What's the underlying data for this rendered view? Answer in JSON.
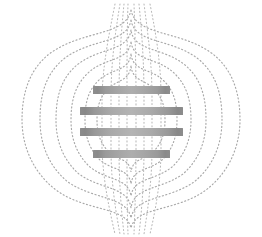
{
  "figure": {
    "background_color": "#ffffff",
    "width": 262,
    "height": 237
  },
  "chart_data": {
    "type": "diagram",
    "xlabel": "",
    "ylabel": "",
    "grid": false,
    "legend": null,
    "axis_ranges": {
      "x": [
        0,
        262
      ],
      "y": [
        0,
        237
      ]
    },
    "elements": {
      "coil_bars": [
        {
          "name": "coil-bar-1",
          "kind": "short",
          "x": 93,
          "y": 86,
          "width": 77,
          "height": 8,
          "fill_edge_color": "#8e8e8e",
          "fill_center_color": "#aeaeae"
        },
        {
          "name": "coil-bar-2",
          "kind": "long",
          "x": 80,
          "y": 107,
          "width": 103,
          "height": 8,
          "fill_edge_color": "#8c8c8c",
          "fill_center_color": "#b4b4b4"
        },
        {
          "name": "coil-bar-3",
          "kind": "long",
          "x": 80,
          "y": 128,
          "width": 103,
          "height": 8,
          "fill_edge_color": "#8c8c8c",
          "fill_center_color": "#b4b4b4"
        },
        {
          "name": "coil-bar-4",
          "kind": "short",
          "x": 93,
          "y": 150,
          "width": 77,
          "height": 8,
          "fill_edge_color": "#8e8e8e",
          "fill_center_color": "#aeaeae"
        }
      ],
      "field_lines": {
        "style": "dotted",
        "stroke_color": "#a8a8a8",
        "stroke_width": 1.15,
        "dash_pattern": "1.1 2.5",
        "loop_count": 6,
        "axis_line_count": 8,
        "loops": [
          {
            "name": "field-loop-outer-1",
            "half_width": 108,
            "top_y": 10,
            "bottom_y": 228
          },
          {
            "name": "field-loop-outer-2",
            "half_width": 88,
            "top_y": 20,
            "bottom_y": 218
          },
          {
            "name": "field-loop-mid-1",
            "half_width": 70,
            "top_y": 30,
            "bottom_y": 208
          },
          {
            "name": "field-loop-mid-2",
            "half_width": 54,
            "top_y": 42,
            "bottom_y": 196
          },
          {
            "name": "field-loop-inner-1",
            "half_width": 40,
            "top_y": 54,
            "bottom_y": 184
          },
          {
            "name": "field-loop-inner-2",
            "half_width": 27,
            "top_y": 66,
            "bottom_y": 172
          }
        ],
        "axis_lines_x": [
          102,
          111,
          120,
          128,
          136,
          144,
          152,
          161
        ]
      }
    },
    "colors": {
      "background": "#ffffff",
      "field_line": "#a8a8a8",
      "coil_dark": "#8a8a8a",
      "coil_light": "#b4b4b4"
    }
  }
}
